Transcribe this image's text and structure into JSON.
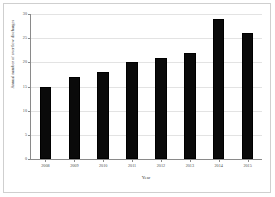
{
  "chart_data": {
    "type": "bar",
    "title": "",
    "xlabel": "Year",
    "ylabel": "Annual number of overflow discharges",
    "categories": [
      "2008",
      "2009",
      "2010",
      "2011",
      "2012",
      "2013",
      "2014",
      "2015"
    ],
    "values": [
      15,
      17,
      18,
      20,
      21,
      22,
      29,
      26
    ],
    "ylim": [
      0,
      30
    ],
    "yticks": [
      0,
      5,
      10,
      15,
      20,
      25,
      30
    ],
    "ytick_labels": [
      "0",
      "5",
      "10",
      "15",
      "20",
      "25",
      "30"
    ],
    "grid": true,
    "legend": false,
    "bar_color": "#0a0a0a"
  }
}
